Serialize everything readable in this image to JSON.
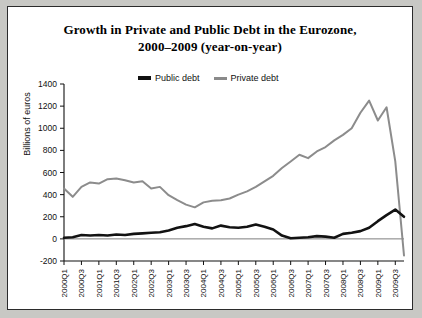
{
  "figure": {
    "title_line1": "Growth in Private and Public Debt in the Eurozone,",
    "title_line2": "2000–2009 (year-on-year)",
    "background": "#ffffff",
    "border_color": "#2b2b2b"
  },
  "legend": {
    "position": "top-center-inside",
    "items": [
      {
        "label": "Public debt",
        "color": "#121212"
      },
      {
        "label": "Private debt",
        "color": "#8c8c8c"
      }
    ]
  },
  "chart_data": {
    "type": "line",
    "title": "Growth in Private and Public Debt in the Eurozone, 2000–2009 (year-on-year)",
    "xlabel": "",
    "ylabel": "Billions of euros",
    "ylim": [
      -200,
      1400
    ],
    "ytick_values": [
      -200,
      0,
      200,
      400,
      600,
      800,
      1000,
      1200,
      1400
    ],
    "ytick_labels": [
      "-200",
      "0",
      "200",
      "400",
      "600",
      "800",
      "1000",
      "1200",
      "1400"
    ],
    "grid": false,
    "zero_line": true,
    "legend_position": "top-center",
    "x": [
      "2000Q1",
      "2000Q2",
      "2000Q3",
      "2000Q4",
      "2001Q1",
      "2001Q2",
      "2001Q3",
      "2001Q4",
      "2002Q1",
      "2002Q2",
      "2002Q3",
      "2002Q4",
      "2003Q1",
      "2003Q2",
      "2003Q3",
      "2003Q4",
      "2004Q1",
      "2004Q2",
      "2004Q3",
      "2004Q4",
      "2005Q1",
      "2005Q2",
      "2005Q3",
      "2005Q4",
      "2006Q1",
      "2006Q2",
      "2006Q3",
      "2006Q4",
      "2007Q1",
      "2007Q2",
      "2007Q3",
      "2007Q4",
      "2008Q1",
      "2008Q2",
      "2008Q3",
      "2008Q4",
      "2009Q1",
      "2009Q2",
      "2009Q3",
      "2009Q4"
    ],
    "xtick_labels": [
      "2000Q1",
      "2000Q3",
      "2001Q1",
      "2001Q3",
      "2002Q1",
      "2002Q3",
      "2003Q1",
      "2003Q3",
      "2004Q1",
      "2004Q3",
      "2005Q1",
      "2005Q3",
      "2006Q1",
      "2006Q3",
      "2007Q1",
      "2007Q3",
      "2008Q1",
      "2008Q3",
      "2009Q1",
      "2009Q3"
    ],
    "xtick_every": 2,
    "series": [
      {
        "name": "Private debt",
        "color": "#8c8c8c",
        "values": [
          455,
          380,
          470,
          510,
          500,
          540,
          545,
          530,
          510,
          520,
          455,
          470,
          395,
          350,
          310,
          285,
          330,
          345,
          350,
          365,
          400,
          430,
          470,
          520,
          570,
          640,
          700,
          760,
          730,
          790,
          830,
          890,
          940,
          1000,
          1140,
          1250,
          1070,
          1190,
          700,
          -150
        ]
      },
      {
        "name": "Public debt",
        "color": "#121212",
        "values": [
          10,
          15,
          35,
          30,
          35,
          30,
          40,
          35,
          45,
          50,
          55,
          60,
          75,
          100,
          115,
          135,
          110,
          95,
          120,
          105,
          100,
          110,
          130,
          110,
          85,
          30,
          5,
          10,
          15,
          25,
          20,
          10,
          45,
          55,
          70,
          100,
          160,
          215,
          265,
          200
        ]
      }
    ]
  },
  "axes": {
    "y_axis_title": "Billions of euros"
  }
}
